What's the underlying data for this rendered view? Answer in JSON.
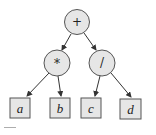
{
  "diagram": {
    "type": "expression-tree",
    "expression": "(a * b) + (c / d)",
    "root": {
      "label": "+",
      "shape": "circle",
      "children": [
        {
          "label": "*",
          "shape": "circle",
          "children": [
            {
              "label": "a",
              "shape": "box"
            },
            {
              "label": "b",
              "shape": "box"
            }
          ]
        },
        {
          "label": "/",
          "shape": "circle",
          "children": [
            {
              "label": "c",
              "shape": "box"
            },
            {
              "label": "d",
              "shape": "box"
            }
          ]
        }
      ]
    },
    "nodes": {
      "plus": "+",
      "mul": "*",
      "div": "/",
      "a": "a",
      "b": "b",
      "c": "c",
      "d": "d"
    },
    "colors": {
      "node_fill": "#e6e6e6",
      "stroke": "#555555",
      "edge": "#333333",
      "text": "#222222"
    }
  }
}
